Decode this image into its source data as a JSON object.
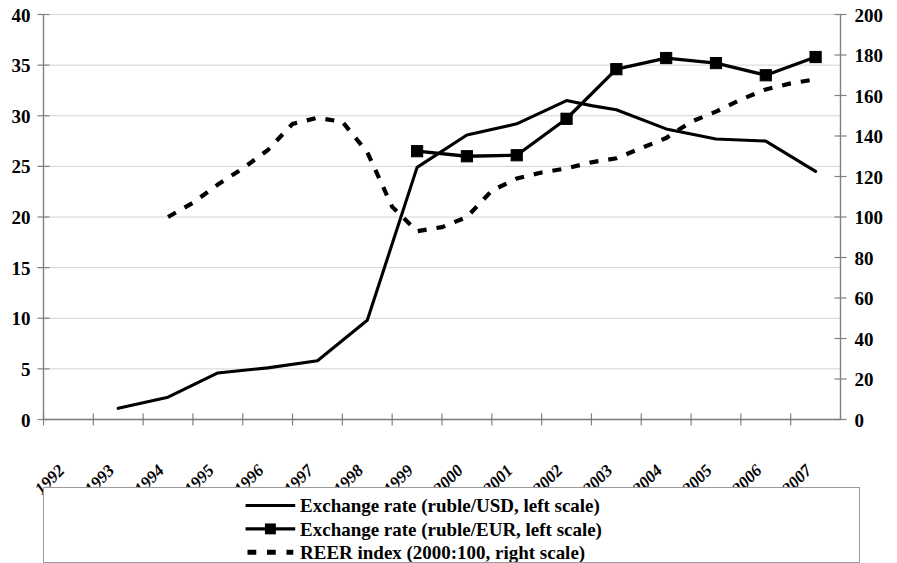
{
  "chart_data": {
    "type": "line",
    "title": "",
    "xlabel": "",
    "ylabel": "",
    "y2label": "",
    "grid": true,
    "legend_position": "bottom",
    "x": [
      1992,
      1993,
      1994,
      1995,
      1996,
      1997,
      1998,
      1999,
      2000,
      2001,
      2002,
      2003,
      2004,
      2005,
      2006,
      2007
    ],
    "categories": [
      "1992",
      "1993",
      "1994",
      "1995",
      "1996",
      "1997",
      "1998",
      "1999",
      "2000",
      "2001",
      "2002",
      "2003",
      "2004",
      "2005",
      "2006",
      "2007"
    ],
    "ylim": [
      0,
      40
    ],
    "yticks": [
      0,
      5,
      10,
      15,
      20,
      25,
      30,
      35,
      40
    ],
    "y2lim": [
      0,
      200
    ],
    "y2ticks": [
      0,
      20,
      40,
      60,
      80,
      100,
      120,
      140,
      160,
      180,
      200
    ],
    "series": [
      {
        "name": "Exchange rate (ruble/USD, left scale)",
        "axis": "left",
        "style": "solid",
        "marker": "none",
        "color": "#000000",
        "x": [
          1993.5,
          1994.5,
          1995.5,
          1996.5,
          1997.5,
          1998.5,
          1999.5,
          2000.5,
          2001.5,
          2002.5,
          2003.0,
          2003.5,
          2004.5,
          2005.5,
          2006.5,
          2007.5
        ],
        "values": [
          1.1,
          2.2,
          4.6,
          5.1,
          5.8,
          9.8,
          24.9,
          28.1,
          29.2,
          31.5,
          31.0,
          30.6,
          28.7,
          27.7,
          27.5,
          24.5
        ]
      },
      {
        "name": "Exchange rate (ruble/EUR, left scale)",
        "axis": "left",
        "style": "solid",
        "marker": "square",
        "color": "#000000",
        "x": [
          1999.5,
          2000.5,
          2001.5,
          2002.5,
          2003.5,
          2004.5,
          2005.5,
          2006.5,
          2007.5
        ],
        "values": [
          26.5,
          26.0,
          26.1,
          29.7,
          34.6,
          35.7,
          35.2,
          34.0,
          35.8
        ]
      },
      {
        "name": "REER index (2000:100, right scale)",
        "axis": "right",
        "style": "dashed",
        "marker": "none",
        "color": "#000000",
        "x": [
          1994.5,
          1995.0,
          1995.5,
          1996.0,
          1996.5,
          1997.0,
          1997.5,
          1998.0,
          1998.5,
          1999.0,
          1999.5,
          2000.0,
          2000.5,
          2001.0,
          2001.5,
          2002.0,
          2002.5,
          2003.0,
          2003.5,
          2004.0,
          2004.5,
          2005.0,
          2005.5,
          2006.0,
          2006.5,
          2007.0,
          2007.5
        ],
        "values": [
          100,
          107,
          116,
          124,
          133,
          146,
          149,
          147,
          132,
          105,
          93,
          95,
          100,
          113,
          119,
          122,
          124,
          127,
          129,
          134,
          139,
          147,
          152,
          158,
          163,
          166,
          168
        ]
      }
    ]
  },
  "legend": {
    "items": [
      {
        "label": "Exchange rate (ruble/USD, left scale)",
        "style": "solid",
        "marker": "none"
      },
      {
        "label": "Exchange rate (ruble/EUR, left scale)",
        "style": "solid",
        "marker": "square"
      },
      {
        "label": "REER index (2000:100, right scale)",
        "style": "dashed",
        "marker": "none"
      }
    ]
  }
}
